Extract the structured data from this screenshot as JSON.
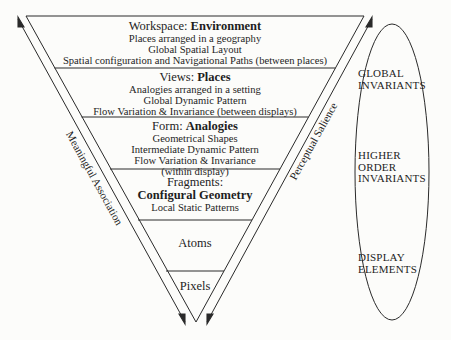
{
  "levels": [
    {
      "prefix": "Workspace: ",
      "name": "Environment",
      "lines": [
        "Places arranged in a geography",
        "Global Spatial Layout",
        "Spatial configuration and Navigational Paths (between places)"
      ]
    },
    {
      "prefix": "Views: ",
      "name": "Places",
      "lines": [
        "Analogies arranged in a setting",
        "Global Dynamic Pattern",
        "Flow Variation & Invariance (between displays)"
      ]
    },
    {
      "prefix": "Form: ",
      "name": "Analogies",
      "lines": [
        "Geometrical Shapes",
        "Intermediate Dynamic Pattern",
        "Flow Variation & Invariance",
        "(within display)"
      ]
    },
    {
      "prefix": "Fragments:",
      "name": "Configural Geometry",
      "lines": [
        "Local Static Patterns"
      ]
    },
    {
      "prefix": "",
      "name": "",
      "plain": "Atoms",
      "lines": []
    },
    {
      "prefix": "",
      "name": "",
      "plain": "Pixels",
      "lines": []
    }
  ],
  "axes": {
    "left": "Meaningful Association",
    "right": "Perceptual Salience"
  },
  "ellipse_labels": [
    {
      "line1": "GLOBAL",
      "line2": "INVARIANTS",
      "line3": ""
    },
    {
      "line1": "HIGHER",
      "line2": "ORDER",
      "line3": "INVARIANTS"
    },
    {
      "line1": "DISPLAY",
      "line2": "ELEMENTS",
      "line3": ""
    }
  ],
  "colors": {
    "line": "#2a2a2a",
    "background": "#fcfcfa"
  }
}
